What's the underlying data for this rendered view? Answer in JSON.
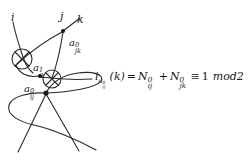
{
  "figure": {
    "type": "knot-crossing-diagram",
    "background_color": "#ffffff",
    "stroke_color": "#2a2a2a",
    "text_color": "#1a1a1a"
  },
  "nodes": [
    {
      "id": "i",
      "label": "i",
      "x": 11,
      "y": 12
    },
    {
      "id": "j",
      "label": "j",
      "x": 60,
      "y": 11
    },
    {
      "id": "k",
      "label": "k",
      "x": 77,
      "y": 14
    }
  ],
  "vertex_dots": [
    {
      "name": "vertex-j",
      "cx": 63,
      "cy": 31
    },
    {
      "name": "vertex-ik",
      "cx": 40,
      "cy": 76
    },
    {
      "name": "vertex-ij",
      "cx": 46,
      "cy": 93
    }
  ],
  "crossings": [
    {
      "name": "crossing-upper-left",
      "cx": 22,
      "cy": 59,
      "r": 10
    },
    {
      "name": "crossing-lower-mid",
      "cx": 52,
      "cy": 79,
      "r": 9
    }
  ],
  "edge_labels": [
    {
      "name": "edge-label-a0jk",
      "base": "a",
      "sup": "0",
      "sub": "jk",
      "x": 69,
      "y": 38
    },
    {
      "name": "edge-label-a1ik",
      "base": "a",
      "sup": "1",
      "sub": "ik",
      "x": 33,
      "y": 63
    },
    {
      "name": "edge-label-a0ij",
      "base": "a",
      "sup": "0",
      "sub": "ij",
      "x": 24,
      "y": 84
    }
  ],
  "formula": {
    "name": "index-equation",
    "x": 95,
    "y": 71,
    "lhs_base": "i",
    "lhs_sub_base": "a",
    "lhs_sub_sup": "0",
    "lhs_sub_sub": "ij",
    "lhs_arg": "(k)",
    "equals": "=",
    "term1_base": "N",
    "term1_sup": "0",
    "term1_sub": "ij",
    "plus": "+",
    "term2_base": "N",
    "term2_sup": "0",
    "term2_sub": "jk",
    "congruent": "≡",
    "value": "1",
    "modulus": "mod2"
  }
}
